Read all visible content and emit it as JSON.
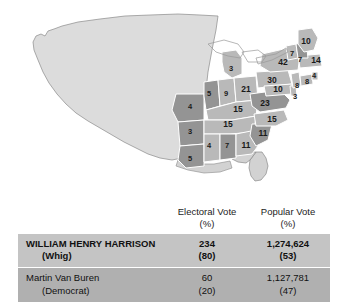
{
  "map": {
    "title": "Election of 1840 electoral map",
    "colors": {
      "winner_state_fill": "#b9b9b9",
      "runner_state_fill": "#949494",
      "territory_fill": "#dcdcdc",
      "unshaded_fill": "#d2d2d2",
      "border": "#6e6e6e"
    },
    "states": [
      {
        "name": "Maine",
        "abbr": "ME",
        "votes": "10",
        "winner": "harrison",
        "x": 306,
        "y": 42
      },
      {
        "name": "Vermont",
        "abbr": "VT",
        "votes": "7",
        "winner": "harrison",
        "x": 292,
        "y": 54
      },
      {
        "name": "New Hampshire",
        "abbr": "NH",
        "votes": "7",
        "winner": "vanburen",
        "x": 300,
        "y": 60
      },
      {
        "name": "Massachusetts",
        "abbr": "MA",
        "votes": "14",
        "winner": "harrison",
        "x": 316,
        "y": 61
      },
      {
        "name": "New York",
        "abbr": "NY",
        "votes": "42",
        "winner": "harrison",
        "x": 283,
        "y": 63
      },
      {
        "name": "Rhode Island",
        "abbr": "RI",
        "votes": "4",
        "winner": "harrison",
        "x": 314,
        "y": 76
      },
      {
        "name": "Connecticut",
        "abbr": "CT",
        "votes": "8",
        "winner": "harrison",
        "x": 307,
        "y": 82
      },
      {
        "name": "New Jersey",
        "abbr": "NJ",
        "votes": "8",
        "winner": "harrison",
        "x": 297,
        "y": 86
      },
      {
        "name": "Pennsylvania",
        "abbr": "PA",
        "votes": "30",
        "winner": "harrison",
        "x": 272,
        "y": 81
      },
      {
        "name": "Maryland",
        "abbr": "MD",
        "votes": "10",
        "winner": "harrison",
        "x": 278,
        "y": 90
      },
      {
        "name": "Delaware",
        "abbr": "DE",
        "votes": "3",
        "winner": "harrison",
        "x": 295,
        "y": 97
      },
      {
        "name": "Michigan",
        "abbr": "MI",
        "votes": "3",
        "winner": "harrison",
        "x": 231,
        "y": 69
      },
      {
        "name": "Ohio",
        "abbr": "OH",
        "votes": "21",
        "winner": "harrison",
        "x": 246,
        "y": 90
      },
      {
        "name": "Indiana",
        "abbr": "IN",
        "votes": "9",
        "winner": "harrison",
        "x": 226,
        "y": 94
      },
      {
        "name": "Illinois",
        "abbr": "IL",
        "votes": "5",
        "winner": "vanburen",
        "x": 209,
        "y": 94
      },
      {
        "name": "Missouri",
        "abbr": "MO",
        "votes": "4",
        "winner": "vanburen",
        "x": 190,
        "y": 107
      },
      {
        "name": "Kentucky",
        "abbr": "KY",
        "votes": "15",
        "winner": "harrison",
        "x": 238,
        "y": 110
      },
      {
        "name": "Virginia",
        "abbr": "VA",
        "votes": "23",
        "winner": "vanburen",
        "x": 265,
        "y": 104
      },
      {
        "name": "Tennessee",
        "abbr": "TN",
        "votes": "15",
        "winner": "harrison",
        "x": 228,
        "y": 125
      },
      {
        "name": "North Carolina",
        "abbr": "NC",
        "votes": "15",
        "winner": "harrison",
        "x": 272,
        "y": 120
      },
      {
        "name": "Arkansas",
        "abbr": "AR",
        "votes": "3",
        "winner": "vanburen",
        "x": 190,
        "y": 132
      },
      {
        "name": "South Carolina",
        "abbr": "SC",
        "votes": "11",
        "winner": "vanburen",
        "x": 263,
        "y": 134
      },
      {
        "name": "Georgia",
        "abbr": "GA",
        "votes": "11",
        "winner": "harrison",
        "x": 246,
        "y": 146
      },
      {
        "name": "Alabama",
        "abbr": "AL",
        "votes": "7",
        "winner": "vanburen",
        "x": 227,
        "y": 146
      },
      {
        "name": "Mississippi",
        "abbr": "MS",
        "votes": "4",
        "winner": "harrison",
        "x": 209,
        "y": 146
      },
      {
        "name": "Louisiana",
        "abbr": "LA",
        "votes": "5",
        "winner": "vanburen",
        "x": 190,
        "y": 159
      }
    ]
  },
  "table": {
    "headers": {
      "candidate": "",
      "electoral_vote": "Electoral Vote",
      "electoral_vote_unit": "(%)",
      "popular_vote": "Popular Vote",
      "popular_vote_unit": "(%)"
    },
    "rows": [
      {
        "candidate": "WILLIAM HENRY HARRISON",
        "party": "(Whig)",
        "electoral_vote": "234",
        "electoral_pct": "(80)",
        "popular_vote": "1,274,624",
        "popular_pct": "(53)",
        "winner": true
      },
      {
        "candidate": "Martin Van Buren",
        "party": "(Democrat)",
        "electoral_vote": "60",
        "electoral_pct": "(20)",
        "popular_vote": "1,127,781",
        "popular_pct": "(47)",
        "winner": false
      }
    ]
  }
}
